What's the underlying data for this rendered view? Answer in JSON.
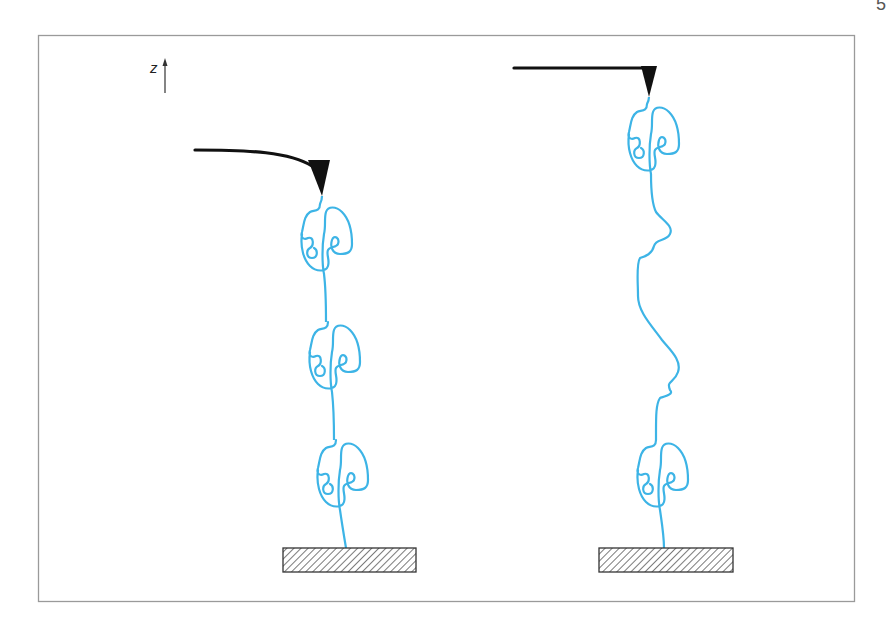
{
  "figure": {
    "page_mark": "5",
    "axis": {
      "label": "z",
      "direction": "up"
    },
    "colors": {
      "frame": "#9a9a9a",
      "protein_chain": "#3db4e6",
      "cantilever": "#111111",
      "substrate_hatch": "#333333"
    },
    "panels": [
      {
        "name": "left",
        "description": "AFM cantilever bent (deflected) attached to chain of 3 folded protein domains on substrate",
        "cantilever_state": "deflected",
        "folded_domains": 3,
        "unfolded_segments": 0
      },
      {
        "name": "right",
        "description": "AFM cantilever straight, one domain unfolded into extended chain between two folded domains",
        "cantilever_state": "relaxed",
        "folded_domains": 2,
        "unfolded_segments": 1
      }
    ]
  }
}
